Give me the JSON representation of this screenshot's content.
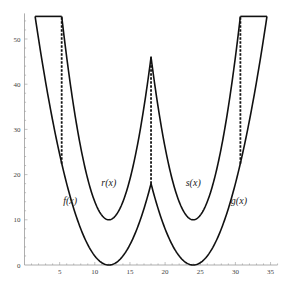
{
  "chart_data": {
    "type": "line",
    "title": "",
    "xlabel": "",
    "ylabel": "",
    "xlim": [
      0,
      36
    ],
    "ylim": [
      0,
      55
    ],
    "grid": false,
    "x_ticks": [
      5,
      10,
      15,
      20,
      25,
      30,
      35
    ],
    "y_ticks": [
      0,
      10,
      20,
      30,
      40,
      50
    ],
    "cap": 55,
    "series": [
      {
        "name": "f(x)",
        "formula": "0.5*(x-12)^2",
        "domain": [
          1.51,
          18
        ],
        "min_point": [
          12,
          0
        ]
      },
      {
        "name": "g(x)",
        "formula": "0.5*(x-24)^2",
        "domain": [
          18,
          34.49
        ],
        "min_point": [
          24,
          0
        ]
      },
      {
        "name": "r(x)",
        "formula": "(x-12)^2+10",
        "domain": [
          5.29,
          18
        ],
        "min_point": [
          12,
          10
        ]
      },
      {
        "name": "s(x)",
        "formula": "(x-24)^2+10",
        "domain": [
          18,
          30.71
        ],
        "min_point": [
          24,
          10
        ]
      }
    ],
    "dashed_segments": [
      {
        "x": 5.29,
        "y_from": 22.4,
        "y_to": 55
      },
      {
        "x": 18,
        "y_from": 18,
        "y_to": 46
      },
      {
        "x": 30.71,
        "y_from": 22.4,
        "y_to": 55
      }
    ],
    "annotations": [
      {
        "text": "f(x)",
        "x": 6.5,
        "y": 13.5
      },
      {
        "text": "r(x)",
        "x": 12,
        "y": 17.5
      },
      {
        "text": "s(x)",
        "x": 24,
        "y": 17.5
      },
      {
        "text": "g(x)",
        "x": 30.5,
        "y": 13.5
      }
    ]
  }
}
